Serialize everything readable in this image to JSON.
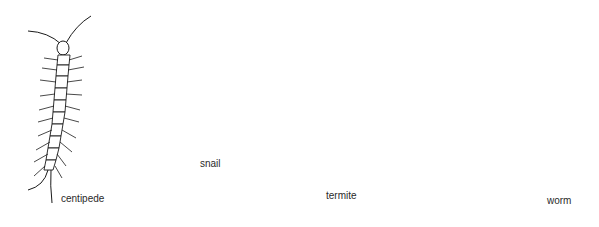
{
  "figure": {
    "animals": [
      {
        "name": "centipede",
        "label": "centipede"
      },
      {
        "name": "snail",
        "label": "snail"
      },
      {
        "name": "termite",
        "label": "termite"
      },
      {
        "name": "worm",
        "label": "worm"
      }
    ],
    "colors": {
      "ink": "#1a1a1a",
      "background": "#ffffff"
    }
  }
}
